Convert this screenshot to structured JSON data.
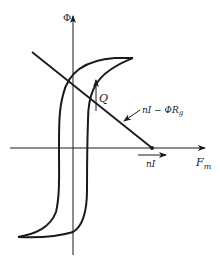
{
  "diagram": {
    "type": "magnetic hysteresis loop with load line",
    "axes": {
      "y_label": "Φ",
      "x_label": "F",
      "x_label_sub": "m"
    },
    "labels": {
      "operating_point": "Q",
      "load_line_main": "nI − ΦR",
      "load_line_sub": "g",
      "intercept": "nI"
    },
    "colors": {
      "line": "#1a1a1a",
      "background": "#ffffff"
    }
  }
}
